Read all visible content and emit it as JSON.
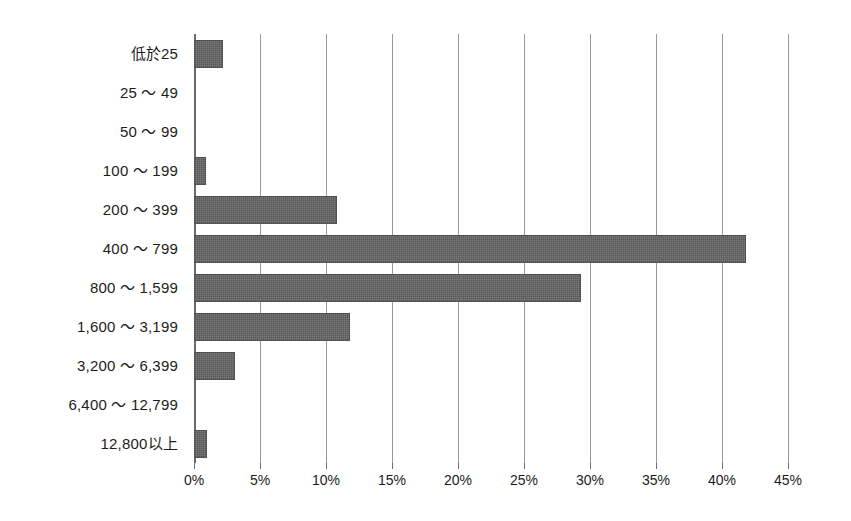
{
  "chart_data": {
    "type": "bar",
    "orientation": "horizontal",
    "title": "",
    "subtitle": "",
    "xlabel": "",
    "ylabel": "",
    "xlim": [
      0,
      45
    ],
    "x_tick_step": 5,
    "x_tick_labels": [
      "0%",
      "5%",
      "10%",
      "15%",
      "20%",
      "25%",
      "30%",
      "35%",
      "40%",
      "45%"
    ],
    "x_tick_values": [
      0,
      5,
      10,
      15,
      20,
      25,
      30,
      35,
      40,
      45
    ],
    "grid": "vertical",
    "legend": "none",
    "value_unit": "%",
    "categories": [
      "低於25",
      "25 ～ 49",
      "50 ～ 99",
      "100 ～ 199",
      "200 ～ 399",
      "400 ～ 799",
      "800 ～ 1,599",
      "1,600 ～ 3,199",
      "3,200 ～ 6,399",
      "6,400 ～ 12,799",
      "12,800以上"
    ],
    "values": [
      2.2,
      0,
      0,
      0.9,
      10.8,
      41.8,
      29.3,
      11.8,
      3.1,
      0,
      1.0
    ],
    "series": [
      {
        "name": "",
        "values": [
          2.2,
          0,
          0,
          0.9,
          10.8,
          41.8,
          29.3,
          11.8,
          3.1,
          0,
          1.0
        ]
      }
    ]
  },
  "style": {
    "bar_color": "#585858",
    "gridline_color": "#9a9a9a",
    "axis_color": "#6b6b6b",
    "text_color": "#1c1c1c",
    "background_color": "#ffffff"
  }
}
